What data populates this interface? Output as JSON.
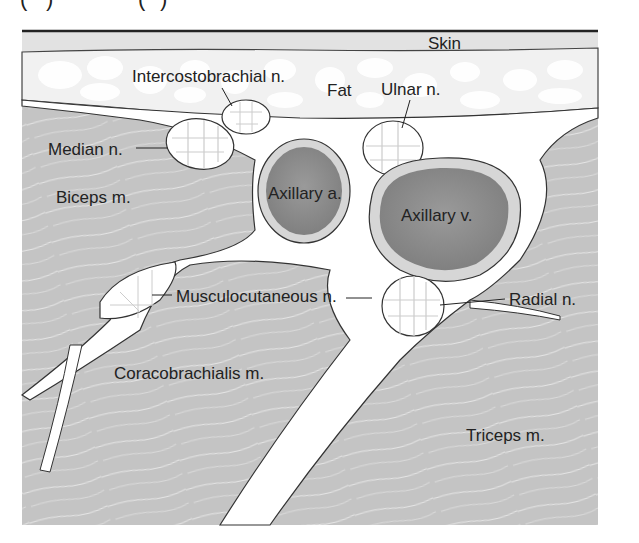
{
  "figure": {
    "top_labels": [
      "(",
      ")",
      "(",
      ")"
    ],
    "colors": {
      "muscle": "#c4c4c4",
      "skin": "#e2e2e2",
      "fat_bg": "#f2f2f2",
      "vessel_dark": "#8a8a8a",
      "vessel_rim": "#d6d6d6",
      "outline": "#333333",
      "connective": "#ffffff"
    },
    "labels": {
      "skin": "Skin",
      "fat": "Fat",
      "intercostobrachial": "Intercostobrachial n.",
      "ulnar": "Ulnar n.",
      "median": "Median n.",
      "biceps": "Biceps m.",
      "axillary_artery": "Axillary a.",
      "axillary_vein": "Axillary v.",
      "musculocutaneous": "Musculocutaneous n.",
      "radial": "Radial n.",
      "coracobrachialis": "Coracobrachialis m.",
      "triceps": "Triceps m."
    }
  }
}
